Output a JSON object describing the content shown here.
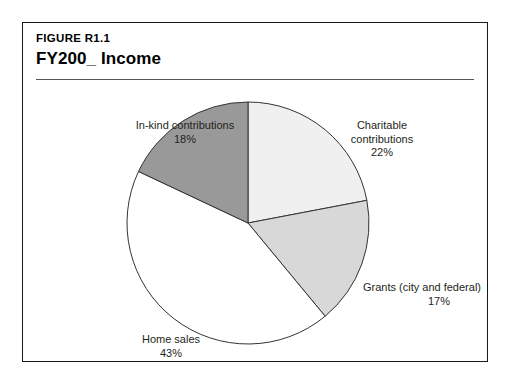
{
  "figure": {
    "number": "FIGURE R1.1",
    "title": "FY200_ Income"
  },
  "chart_data": {
    "type": "pie",
    "title": "FY200_ Income",
    "xlabel": "",
    "ylabel": "",
    "legend": "none",
    "grid": false,
    "start_angle_deg": 0,
    "direction": "clockwise",
    "categories": [
      "Charitable contributions",
      "Grants (city and federal)",
      "Home sales",
      "In-kind contributions"
    ],
    "values": [
      22,
      17,
      43,
      18
    ],
    "value_unit": "percent",
    "slices": [
      {
        "label": "Charitable contributions",
        "label_line1": "Charitable",
        "label_line2": "contributions",
        "value": 22,
        "value_text": "22%",
        "color": "#f0f0f0"
      },
      {
        "label": "Grants (city and federal)",
        "label_line1": "Grants (city and federal)",
        "label_line2": "",
        "value": 17,
        "value_text": "17%",
        "color": "#d8d8d8"
      },
      {
        "label": "Home sales",
        "label_line1": "Home sales",
        "label_line2": "",
        "value": 43,
        "value_text": "43%",
        "color": "#ffffff"
      },
      {
        "label": "In-kind contributions",
        "label_line1": "In-kind contributions",
        "label_line2": "",
        "value": 18,
        "value_text": "18%",
        "color": "#999999"
      }
    ],
    "outline_color": "#333333",
    "frame_color": "#1a1a1a",
    "background": "#ffffff"
  }
}
